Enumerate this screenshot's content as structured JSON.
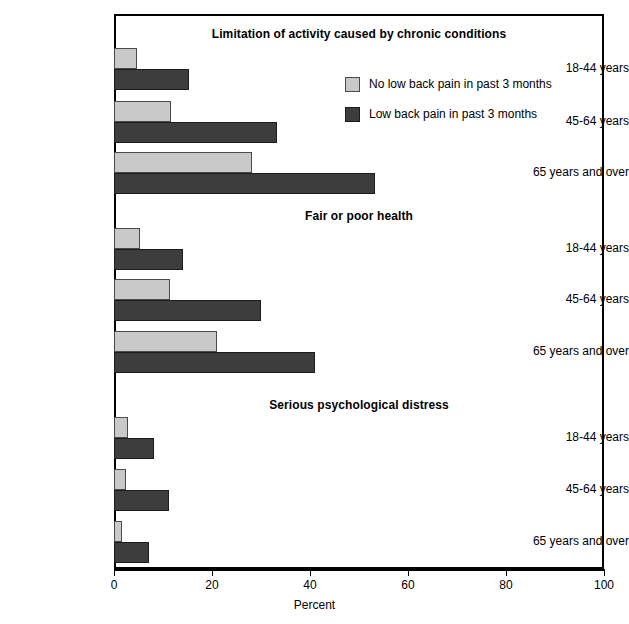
{
  "chart_data": {
    "type": "bar",
    "orientation": "horizontal",
    "title": "",
    "xlabel": "Percent",
    "ylabel": "",
    "xlim": [
      0,
      100
    ],
    "xticks": [
      0,
      20,
      40,
      60,
      80,
      100
    ],
    "grid": false,
    "legend_position": "upper-right-inside",
    "categories": [
      "18-44 years",
      "45-64 years",
      "65 years and over"
    ],
    "series": [
      {
        "name": "No low back pain in past 3 months",
        "color": "#c9c9c9"
      },
      {
        "name": "Low back pain in past 3 months",
        "color": "#3d3d3d"
      }
    ],
    "panels": [
      {
        "title": "Limitation of activity caused by chronic conditions",
        "categories": [
          "18-44 years",
          "45-64 years",
          "65 years and over"
        ],
        "series": [
          {
            "name": "No low back pain in past 3 months",
            "values": [
              4.6,
              11.6,
              28.2
            ]
          },
          {
            "name": "Low back pain in past 3 months",
            "values": [
              15.4,
              33.3,
              53.3
            ]
          }
        ]
      },
      {
        "title": "Fair or poor health",
        "categories": [
          "18-44 years",
          "45-64 years",
          "65 years and over"
        ],
        "series": [
          {
            "name": "No low back pain in past 3 months",
            "values": [
              5.4,
              11.4,
              21.0
            ]
          },
          {
            "name": "Low back pain in past 3 months",
            "values": [
              14.0,
              30.0,
              41.0
            ]
          }
        ]
      },
      {
        "title": "Serious psychological distress",
        "categories": [
          "18-44 years",
          "45-64 years",
          "65 years and over"
        ],
        "series": [
          {
            "name": "No low back pain in past 3 months",
            "values": [
              2.8,
              2.4,
              1.6
            ]
          },
          {
            "name": "Low back pain in past 3 months",
            "values": [
              8.2,
              11.2,
              7.2
            ]
          }
        ]
      }
    ]
  },
  "axis": {
    "x_title": "Percent",
    "tick_labels": [
      "0",
      "20",
      "40",
      "60",
      "80",
      "100"
    ]
  },
  "legend": {
    "items": [
      {
        "label": "No low back pain in past 3 months",
        "swatch": "light"
      },
      {
        "label": "Low back pain in past 3 months",
        "swatch": "dark"
      }
    ]
  },
  "panel_titles": [
    "Limitation of activity caused by chronic conditions",
    "Fair or poor health",
    "Serious psychological distress"
  ],
  "category_labels": [
    "18-44 years",
    "45-64 years",
    "65 years and over",
    "18-44 years",
    "45-64 years",
    "65 years and over",
    "18-44 years",
    "45-64 years",
    "65 years and over"
  ]
}
